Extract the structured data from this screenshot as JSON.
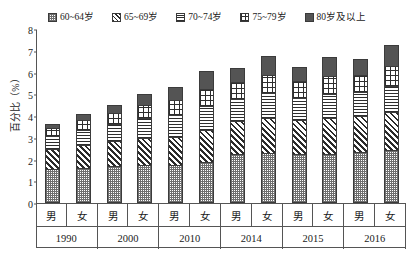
{
  "legend": {
    "items": [
      {
        "label": "60~64岁",
        "pattern": "dots",
        "name": "legend-60-64"
      },
      {
        "label": "65~69岁",
        "pattern": "diag",
        "name": "legend-65-69"
      },
      {
        "label": "70~74岁",
        "pattern": "horz",
        "name": "legend-70-74"
      },
      {
        "label": "75~79岁",
        "pattern": "grid",
        "name": "legend-75-79"
      },
      {
        "label": "80岁及以上",
        "pattern": "solid",
        "name": "legend-80-plus"
      }
    ]
  },
  "axes": {
    "ylabel": "百分比（%）",
    "yticks": [
      "0",
      "1",
      "2",
      "3",
      "4",
      "5",
      "6",
      "7",
      "8"
    ]
  },
  "chart_data": {
    "type": "bar",
    "title": "",
    "subtitle": "",
    "xlabel": "",
    "ylabel": "百分比（%）",
    "ylim": [
      0,
      8
    ],
    "grid": false,
    "stacked": true,
    "legend_position": "top",
    "categories": [
      "1990 男",
      "1990 女",
      "2000 男",
      "2000 女",
      "2010 男",
      "2010 女",
      "2014 男",
      "2014 女",
      "2015 男",
      "2015 女",
      "2016 男",
      "2016 女"
    ],
    "groups": [
      {
        "year": "1990",
        "sexes": [
          "男",
          "女"
        ]
      },
      {
        "year": "2000",
        "sexes": [
          "男",
          "女"
        ]
      },
      {
        "year": "2010",
        "sexes": [
          "男",
          "女"
        ]
      },
      {
        "year": "2014",
        "sexes": [
          "男",
          "女"
        ]
      },
      {
        "year": "2015",
        "sexes": [
          "男",
          "女"
        ]
      },
      {
        "year": "2016",
        "sexes": [
          "男",
          "女"
        ]
      }
    ],
    "series": [
      {
        "name": "60~64岁",
        "pattern": "dots",
        "values": [
          1.55,
          1.6,
          1.7,
          1.75,
          1.75,
          1.9,
          2.25,
          2.3,
          2.25,
          2.25,
          2.35,
          2.45
        ]
      },
      {
        "name": "65~69岁",
        "pattern": "diag",
        "values": [
          0.95,
          1.05,
          1.15,
          1.25,
          1.3,
          1.45,
          1.5,
          1.6,
          1.55,
          1.65,
          1.65,
          1.75
        ]
      },
      {
        "name": "70~74岁",
        "pattern": "horz",
        "values": [
          0.6,
          0.7,
          0.8,
          0.9,
          1.0,
          1.1,
          1.05,
          1.15,
          1.05,
          1.1,
          1.1,
          1.2
        ]
      },
      {
        "name": "75~79岁",
        "pattern": "grid",
        "values": [
          0.35,
          0.45,
          0.5,
          0.6,
          0.7,
          0.8,
          0.75,
          0.85,
          0.75,
          0.85,
          0.8,
          0.9
        ]
      },
      {
        "name": "80岁及以上",
        "pattern": "solid",
        "values": [
          0.2,
          0.3,
          0.35,
          0.5,
          0.6,
          0.8,
          0.65,
          0.85,
          0.65,
          0.85,
          0.7,
          0.95
        ]
      }
    ],
    "totals": [
      3.65,
      4.1,
      4.5,
      5.0,
      5.35,
      6.05,
      6.2,
      6.75,
      6.25,
      6.7,
      6.6,
      7.25
    ]
  }
}
